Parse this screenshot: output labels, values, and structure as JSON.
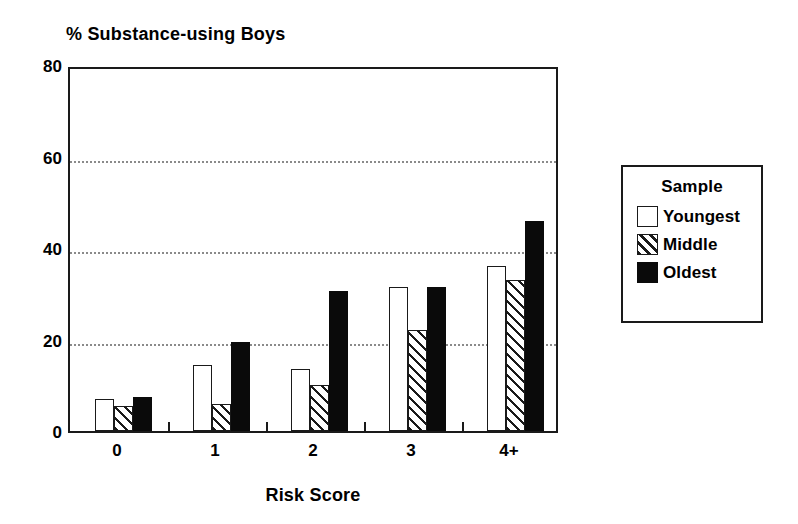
{
  "chart_data": {
    "type": "bar",
    "title": "% Substance-using Boys",
    "xlabel": "Risk Score",
    "ylabel": "",
    "categories": [
      "0",
      "1",
      "2",
      "3",
      "4+"
    ],
    "series": [
      {
        "name": "Youngest",
        "fill": "white",
        "values": [
          7,
          14.5,
          13.5,
          31.5,
          36
        ]
      },
      {
        "name": "Middle",
        "fill": "hatched",
        "values": [
          5.5,
          6,
          10,
          22,
          33
        ]
      },
      {
        "name": "Oldest",
        "fill": "black",
        "values": [
          7.5,
          19.5,
          30.5,
          31.5,
          46
        ]
      }
    ],
    "ylim": [
      0,
      80
    ],
    "yticks": [
      0,
      20,
      40,
      60,
      80
    ],
    "ytick_labels": [
      "0",
      "20",
      "40",
      "60",
      "80"
    ],
    "gridlines": [
      20,
      40,
      60
    ],
    "grid": true,
    "legend_position": "right-outside"
  },
  "legend": {
    "title": "Sample",
    "entries": [
      {
        "label": "Youngest",
        "swatch": "white-square-icon"
      },
      {
        "label": "Middle",
        "swatch": "hatched-square-icon"
      },
      {
        "label": "Oldest",
        "swatch": "black-square-icon"
      }
    ]
  },
  "colors": {
    "axis": "#1a1a1a",
    "grid": "#8a8a8a",
    "bar_oldest": "#0a0a0a",
    "bar_youngest": "#ffffff",
    "background": "#ffffff"
  }
}
